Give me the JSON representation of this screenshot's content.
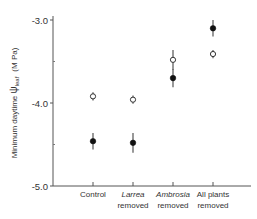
{
  "chart_data": {
    "type": "scatter",
    "title": "",
    "xlabel": "",
    "ylabel": "Minimum daytime ψleaf (MPa)",
    "ylabel_parts": {
      "prefix": "Minimum daytime ",
      "symbol": "ψ",
      "subscript": "leaf",
      "unit": "(M Pa)"
    },
    "ylim": [
      -5.0,
      -3.0
    ],
    "yticks": [
      -5.0,
      -4.0,
      -3.0
    ],
    "ytick_labels": [
      "-5.0",
      "-4.0",
      "-3.0"
    ],
    "minor_yticks": [
      -4.5,
      -3.5
    ],
    "grid": false,
    "legend": null,
    "categories": [
      {
        "line1": "Control",
        "line2": "",
        "italic": false
      },
      {
        "line1": "Larrea",
        "line2": "removed",
        "italic": true
      },
      {
        "line1": "Ambrosia",
        "line2": "removed",
        "italic": true
      },
      {
        "line1": "All plants",
        "line2": "removed",
        "italic": false
      }
    ],
    "series": [
      {
        "name": "open circles",
        "marker": "open-circle",
        "values": [
          -3.92,
          -3.96,
          -3.48,
          -3.41
        ],
        "error": [
          0.05,
          0.05,
          0.12,
          0.05
        ]
      },
      {
        "name": "filled circles",
        "marker": "filled-circle",
        "values": [
          -4.46,
          -4.48,
          -3.7,
          -3.1
        ],
        "error": [
          0.1,
          0.12,
          0.11,
          0.1
        ]
      }
    ]
  }
}
